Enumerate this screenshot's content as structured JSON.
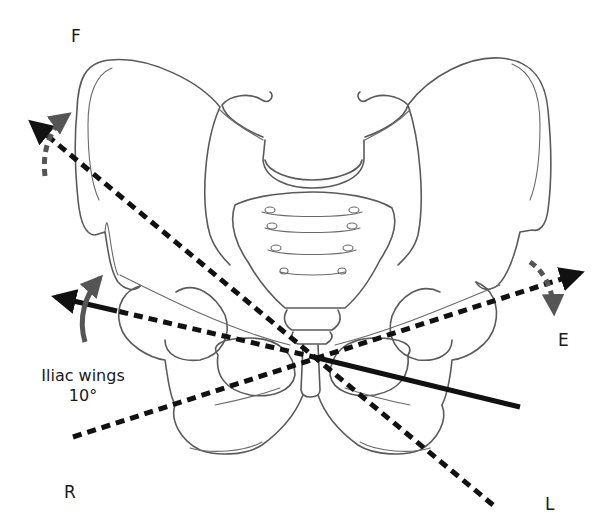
{
  "figure": {
    "type": "anatomical line diagram",
    "colors": {
      "bone_outline": "#5a5a5a",
      "axis_lines": "#111111",
      "rotation_arrows": "#555555",
      "background": "#ffffff"
    }
  },
  "labels": {
    "top_left": "F",
    "right": "E",
    "bottom_left": "R",
    "bottom_right": "L",
    "annotation_line1": "Iliac wings",
    "annotation_line2": "10°"
  },
  "axes": [
    {
      "name": "F-L axis",
      "style": "dashed",
      "from": [
        493,
        505
      ],
      "to": [
        28,
        120
      ],
      "arrowhead": "F end"
    },
    {
      "name": "R-E axis",
      "style": "dashed",
      "from": [
        73,
        437
      ],
      "to": [
        583,
        272
      ],
      "arrowhead": "E end"
    },
    {
      "name": "iliac wings axis",
      "style": "solid/dashed",
      "from": [
        520,
        407
      ],
      "to": [
        52,
        295
      ],
      "arrowhead": "left end"
    }
  ],
  "rotation_arrows": [
    {
      "name": "rotation-arrow-f",
      "style": "dashed gray curved",
      "near": "F"
    },
    {
      "name": "rotation-arrow-e",
      "style": "dashed gray curved",
      "near": "E"
    },
    {
      "name": "rotation-arrow-iliac",
      "style": "solid gray curved",
      "near": "Iliac wings"
    }
  ]
}
